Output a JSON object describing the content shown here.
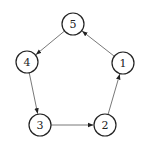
{
  "diagram": {
    "type": "directed-cycle-graph",
    "node_radius": 11,
    "colors": {
      "node_stroke": "#222222",
      "edge": "#555555",
      "background": "#ffffff"
    },
    "nodes": [
      {
        "id": "1",
        "label": "1",
        "x": 123,
        "y": 63
      },
      {
        "id": "2",
        "label": "2",
        "x": 105,
        "y": 125
      },
      {
        "id": "3",
        "label": "3",
        "x": 40,
        "y": 125
      },
      {
        "id": "4",
        "label": "4",
        "x": 27,
        "y": 62
      },
      {
        "id": "5",
        "label": "5",
        "x": 73,
        "y": 24
      }
    ],
    "edges": [
      {
        "from": "1",
        "to": "5"
      },
      {
        "from": "5",
        "to": "4"
      },
      {
        "from": "4",
        "to": "3"
      },
      {
        "from": "3",
        "to": "2"
      },
      {
        "from": "2",
        "to": "1"
      }
    ]
  }
}
